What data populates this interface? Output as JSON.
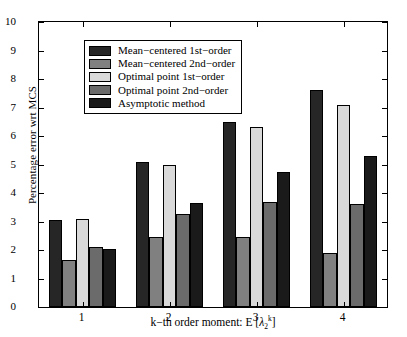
{
  "chart_data": {
    "type": "bar",
    "title": "",
    "xlabel": "k−th order moment: E [λ₂ᵏ]",
    "xlabel_parts": {
      "prefix": "k−th order moment: E [",
      "symbol": "λ",
      "sub": "2",
      "sup": "k",
      "suffix": "]"
    },
    "ylabel": "Percentage error wrt MCS",
    "categories": [
      "1",
      "2",
      "3",
      "4"
    ],
    "ylim": [
      0,
      10
    ],
    "yticks": [
      0,
      1,
      2,
      3,
      4,
      5,
      6,
      7,
      8,
      9,
      10
    ],
    "ytick_labels": [
      "0",
      "1",
      "2",
      "3",
      "4",
      "5",
      "6",
      "7",
      "8",
      "9",
      "10"
    ],
    "grid": false,
    "legend_position": "upper left",
    "series": [
      {
        "name": "Mean−centered 1st−order",
        "color": "#262626",
        "values": [
          3.05,
          5.1,
          6.5,
          7.6
        ]
      },
      {
        "name": "Mean−centered 2nd−order",
        "color": "#808080",
        "values": [
          1.65,
          2.45,
          2.45,
          1.9
        ]
      },
      {
        "name": "Optimal point 1st−order",
        "color": "#d9d9d9",
        "values": [
          3.1,
          5.0,
          6.3,
          7.1
        ]
      },
      {
        "name": "Optimal point 2nd−order",
        "color": "#6b6b6b",
        "values": [
          2.1,
          3.25,
          3.7,
          3.6
        ]
      },
      {
        "name": "Asymptotic method",
        "color": "#1a1a1a",
        "values": [
          2.05,
          3.65,
          4.75,
          5.3
        ]
      }
    ]
  },
  "figure": {
    "axes_color": "#000000",
    "background": "#ffffff"
  }
}
